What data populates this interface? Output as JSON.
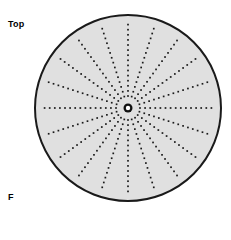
{
  "figure": {
    "labels": {
      "orientation_label": "Top",
      "figure_letter": "F"
    },
    "disc": {
      "center_x": 128,
      "center_y": 108,
      "radius": 93,
      "fill_color": "#e0e0e0",
      "stroke_color": "#1a1a1a",
      "stroke_width": 2
    },
    "hub": {
      "outer_radius": 4.5,
      "inner_radius": 2.2,
      "ring_color": "#111111",
      "hole_color": "#ffffff"
    },
    "spokes": {
      "count": 20,
      "angle_step_degrees": 18,
      "start_angle_degrees": -90,
      "style": "dotted",
      "dot_color": "#1a1a1a",
      "dot_size": 1.7,
      "dot_spacing": 5.1,
      "inner_gap": 12,
      "outer_margin": 5,
      "angles_degrees": [
        0,
        18,
        36,
        54,
        72,
        90,
        108,
        126,
        144,
        162,
        180,
        198,
        216,
        234,
        252,
        270,
        288,
        306,
        324,
        342
      ]
    }
  }
}
